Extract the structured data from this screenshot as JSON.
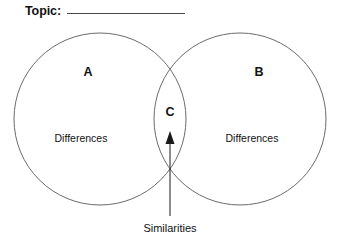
{
  "worksheet": {
    "type": "venn-diagram-worksheet",
    "background_color": "#ffffff",
    "header": {
      "topic_label": "Topic:",
      "topic_value": "",
      "topic_line_color": "#4a4a4a"
    },
    "diagram": {
      "stroke_color": "#6b6b6b",
      "fill_color": "#ffffff",
      "left_circle": {
        "letter": "A",
        "region_label": "Differences",
        "cx": 100,
        "cy": 119,
        "r": 86
      },
      "right_circle": {
        "letter": "B",
        "region_label": "Differences",
        "cx": 240,
        "cy": 119,
        "r": 86
      },
      "intersection": {
        "letter": "C",
        "caption": "Similarities",
        "cx": 170
      },
      "arrow": {
        "color": "#1a1a1a",
        "from_x": 170,
        "from_y": 216,
        "to_x": 170,
        "to_y": 132
      }
    }
  }
}
